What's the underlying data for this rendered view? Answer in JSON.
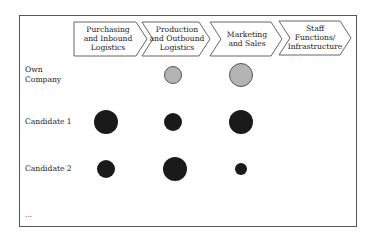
{
  "diagram": {
    "value_chain": [
      {
        "id": "purchasing",
        "lines": [
          "Purchasing",
          "and Inbound",
          "Logistics"
        ]
      },
      {
        "id": "production",
        "lines": [
          "Production",
          "and Outbound",
          "Logistics"
        ]
      },
      {
        "id": "marketing",
        "lines": [
          "Marketing",
          "and Sales"
        ]
      },
      {
        "id": "staff",
        "lines": [
          "Staff",
          "Functions/",
          "Infrastructure"
        ]
      }
    ],
    "rows": [
      {
        "lines": [
          "Own",
          "Company"
        ]
      },
      {
        "lines": [
          "Candidate 1"
        ]
      },
      {
        "lines": [
          "Candidate 2"
        ]
      },
      {
        "lines": [
          "..."
        ]
      }
    ],
    "legend_colors": {
      "own_company": "#b4b4b4",
      "candidate": "#1a1a1a",
      "outline": "#555555"
    },
    "bubbles": [
      {
        "row": "Own Company",
        "activity": "Production and Outbound Logistics",
        "size": "medium"
      },
      {
        "row": "Own Company",
        "activity": "Marketing and Sales",
        "size": "large"
      },
      {
        "row": "Candidate 1",
        "activity": "Purchasing and Inbound Logistics",
        "size": "large"
      },
      {
        "row": "Candidate 1",
        "activity": "Production and Outbound Logistics",
        "size": "medium"
      },
      {
        "row": "Candidate 1",
        "activity": "Marketing and Sales",
        "size": "large"
      },
      {
        "row": "Candidate 2",
        "activity": "Purchasing and Inbound Logistics",
        "size": "medium"
      },
      {
        "row": "Candidate 2",
        "activity": "Production and Outbound Logistics",
        "size": "large"
      },
      {
        "row": "Candidate 2",
        "activity": "Marketing and Sales",
        "size": "small"
      }
    ]
  }
}
